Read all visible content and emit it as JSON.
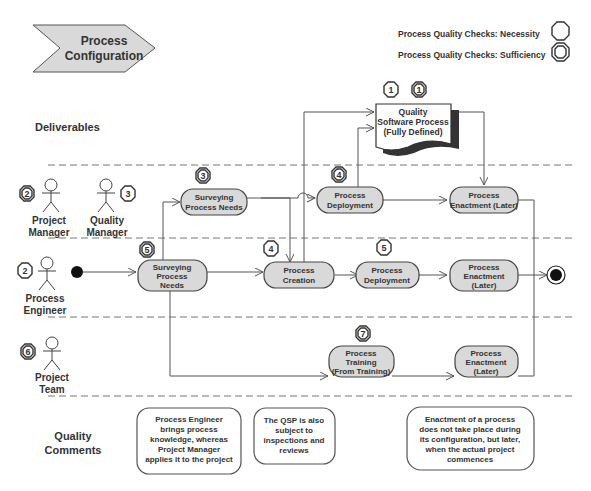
{
  "banner": {
    "line1": "Process",
    "line2": "Configuration"
  },
  "legend": [
    {
      "label": "Process Quality Checks: Necessity",
      "icon": "octagon-single"
    },
    {
      "label": "Process Quality Checks: Sufficiency",
      "icon": "octagon-double"
    }
  ],
  "lanes": {
    "deliverables": "Deliverables",
    "quality_comments": {
      "line1": "Quality",
      "line2": "Comments"
    }
  },
  "actors": [
    {
      "name1": "Project",
      "name2": "Manager",
      "badge": "2",
      "badge_type": "double"
    },
    {
      "name1": "Quality",
      "name2": "Manager",
      "badge": "3",
      "badge_type": "single"
    },
    {
      "name1": "Process",
      "name2": "Engineer",
      "badge": "2",
      "badge_type": "single"
    },
    {
      "name1": "Project",
      "name2": "Team",
      "badge": "6",
      "badge_type": "double"
    }
  ],
  "deliverable": {
    "lines": [
      "Quality",
      "Software Process",
      "(Fully Defined)"
    ],
    "badges": [
      {
        "n": "1",
        "type": "single"
      },
      {
        "n": "1",
        "type": "double"
      }
    ]
  },
  "activities": {
    "pm_survey": {
      "lines": [
        "Surveying",
        "Process Needs"
      ],
      "badge": "3",
      "badge_type": "double"
    },
    "pm_deploy": {
      "lines": [
        "Process",
        "Deployment"
      ],
      "badge": "4",
      "badge_type": "double"
    },
    "pm_enact": {
      "lines": [
        "Process",
        "Enactment (Later)"
      ]
    },
    "pe_survey": {
      "lines": [
        "Surveying",
        "Process",
        "Needs"
      ],
      "badge": "5",
      "badge_type": "double"
    },
    "pe_create": {
      "lines": [
        "Process",
        "Creation"
      ],
      "badge": "4",
      "badge_type": "single"
    },
    "pe_deploy": {
      "lines": [
        "Process",
        "Deployment"
      ],
      "badge": "5",
      "badge_type": "single"
    },
    "pe_enact": {
      "lines": [
        "Process",
        "Enactment",
        "(Later)"
      ]
    },
    "pt_train": {
      "lines": [
        "Process",
        "Training",
        "(From Training)"
      ],
      "badge": "7",
      "badge_type": "double"
    },
    "pt_enact": {
      "lines": [
        "Process",
        "Enactment",
        "(Later)"
      ]
    }
  },
  "comments": [
    {
      "lines": [
        "Process Engineer",
        "brings process",
        "knowledge, whereas",
        "Project Manager",
        "applies it to the project"
      ]
    },
    {
      "lines": [
        "The QSP is also",
        "subject to",
        "inspections and",
        "reviews"
      ]
    },
    {
      "lines": [
        "Enactment of a process",
        "does not take place during",
        "its configuration, but later,",
        "when the actual project",
        "commences"
      ]
    }
  ]
}
